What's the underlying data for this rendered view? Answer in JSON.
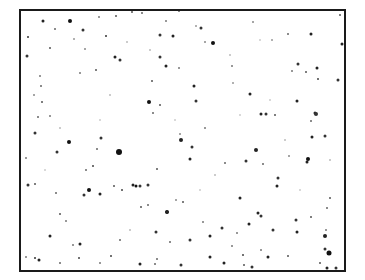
{
  "image": {
    "description": "Star field / speckle pattern framed by a black border",
    "frame_color": "#1a1a1a",
    "background": "#ffffff"
  },
  "dots": [
    [
      43,
      21,
      3,
      "#222"
    ],
    [
      70,
      21,
      4,
      "#111"
    ],
    [
      55,
      29,
      2,
      "#666"
    ],
    [
      116,
      16,
      2,
      "#555"
    ],
    [
      99,
      17,
      2,
      "#777"
    ],
    [
      28,
      37,
      2,
      "#333"
    ],
    [
      50,
      48,
      2,
      "#555"
    ],
    [
      83,
      30,
      3,
      "#333"
    ],
    [
      85,
      49,
      2,
      "#888"
    ],
    [
      106,
      36,
      2,
      "#333"
    ],
    [
      115,
      57,
      3,
      "#222"
    ],
    [
      120,
      60,
      3,
      "#333"
    ],
    [
      74,
      39,
      2,
      "#999"
    ],
    [
      80,
      73,
      2,
      "#777"
    ],
    [
      27,
      56,
      3,
      "#333"
    ],
    [
      41,
      86,
      2,
      "#666"
    ],
    [
      96,
      70,
      2,
      "#555"
    ],
    [
      40,
      76,
      2,
      "#777"
    ],
    [
      132,
      12,
      2,
      "#555"
    ],
    [
      142,
      13,
      2,
      "#666"
    ],
    [
      160,
      35,
      3,
      "#333"
    ],
    [
      173,
      36,
      3,
      "#222"
    ],
    [
      166,
      21,
      2,
      "#777"
    ],
    [
      179,
      11,
      2,
      "#666"
    ],
    [
      201,
      28,
      3,
      "#333"
    ],
    [
      213,
      43,
      4,
      "#111"
    ],
    [
      196,
      26,
      2,
      "#999"
    ],
    [
      160,
      57,
      3,
      "#333"
    ],
    [
      166,
      66,
      3,
      "#222"
    ],
    [
      152,
      81,
      2,
      "#555"
    ],
    [
      179,
      68,
      2,
      "#777"
    ],
    [
      194,
      86,
      3,
      "#222"
    ],
    [
      205,
      42,
      2,
      "#888"
    ],
    [
      232,
      66,
      2,
      "#777"
    ],
    [
      233,
      83,
      2,
      "#999"
    ],
    [
      253,
      22,
      2,
      "#888"
    ],
    [
      272,
      40,
      2,
      "#999"
    ],
    [
      311,
      34,
      3,
      "#222"
    ],
    [
      288,
      34,
      2,
      "#666"
    ],
    [
      342,
      44,
      3,
      "#222"
    ],
    [
      298,
      64,
      3,
      "#333"
    ],
    [
      306,
      72,
      2,
      "#555"
    ],
    [
      318,
      79,
      2,
      "#444"
    ],
    [
      292,
      71,
      2,
      "#777"
    ],
    [
      317,
      68,
      3,
      "#222"
    ],
    [
      338,
      80,
      3,
      "#333"
    ],
    [
      340,
      15,
      2,
      "#555"
    ],
    [
      42,
      102,
      2,
      "#555"
    ],
    [
      38,
      117,
      2,
      "#666"
    ],
    [
      50,
      116,
      2,
      "#777"
    ],
    [
      34,
      95,
      2,
      "#888"
    ],
    [
      35,
      133,
      3,
      "#333"
    ],
    [
      69,
      142,
      4,
      "#111"
    ],
    [
      57,
      152,
      3,
      "#333"
    ],
    [
      101,
      138,
      3,
      "#333"
    ],
    [
      119,
      152,
      6,
      "#111"
    ],
    [
      97,
      149,
      2,
      "#666"
    ],
    [
      93,
      166,
      2,
      "#444"
    ],
    [
      26,
      158,
      2,
      "#777"
    ],
    [
      86,
      170,
      2,
      "#666"
    ],
    [
      28,
      185,
      3,
      "#333"
    ],
    [
      149,
      102,
      4,
      "#111"
    ],
    [
      153,
      113,
      2,
      "#666"
    ],
    [
      160,
      105,
      2,
      "#555"
    ],
    [
      196,
      101,
      3,
      "#333"
    ],
    [
      205,
      128,
      2,
      "#777"
    ],
    [
      180,
      134,
      2,
      "#888"
    ],
    [
      181,
      140,
      4,
      "#222"
    ],
    [
      192,
      147,
      3,
      "#333"
    ],
    [
      190,
      159,
      3,
      "#222"
    ],
    [
      225,
      163,
      2,
      "#666"
    ],
    [
      157,
      169,
      2,
      "#555"
    ],
    [
      250,
      94,
      3,
      "#222"
    ],
    [
      275,
      115,
      2,
      "#555"
    ],
    [
      261,
      114,
      3,
      "#222"
    ],
    [
      266,
      114,
      3,
      "#333"
    ],
    [
      297,
      101,
      3,
      "#222"
    ],
    [
      315,
      113,
      3,
      "#222"
    ],
    [
      316,
      114,
      4,
      "#333"
    ],
    [
      311,
      121,
      2,
      "#666"
    ],
    [
      312,
      137,
      3,
      "#222"
    ],
    [
      325,
      136,
      3,
      "#333"
    ],
    [
      256,
      150,
      4,
      "#222"
    ],
    [
      246,
      161,
      3,
      "#333"
    ],
    [
      307,
      162,
      3,
      "#222"
    ],
    [
      308,
      159,
      4,
      "#111"
    ],
    [
      289,
      156,
      2,
      "#888"
    ],
    [
      278,
      178,
      3,
      "#333"
    ],
    [
      263,
      164,
      2,
      "#666"
    ],
    [
      35,
      184,
      2,
      "#555"
    ],
    [
      56,
      193,
      2,
      "#666"
    ],
    [
      89,
      190,
      4,
      "#111"
    ],
    [
      84,
      195,
      3,
      "#333"
    ],
    [
      100,
      194,
      3,
      "#222"
    ],
    [
      60,
      214,
      2,
      "#555"
    ],
    [
      66,
      221,
      2,
      "#777"
    ],
    [
      50,
      236,
      3,
      "#222"
    ],
    [
      80,
      244,
      3,
      "#222"
    ],
    [
      39,
      260,
      3,
      "#222"
    ],
    [
      35,
      258,
      2,
      "#333"
    ],
    [
      79,
      258,
      2,
      "#444"
    ],
    [
      73,
      245,
      2,
      "#777"
    ],
    [
      114,
      186,
      2,
      "#555"
    ],
    [
      122,
      190,
      2,
      "#444"
    ],
    [
      120,
      240,
      2,
      "#666"
    ],
    [
      133,
      185,
      3,
      "#222"
    ],
    [
      140,
      186,
      3,
      "#333"
    ],
    [
      136,
      186,
      3,
      "#111"
    ],
    [
      148,
      185,
      3,
      "#333"
    ],
    [
      141,
      207,
      2,
      "#555"
    ],
    [
      148,
      205,
      2,
      "#666"
    ],
    [
      167,
      212,
      4,
      "#111"
    ],
    [
      167,
      212,
      3,
      "#222"
    ],
    [
      183,
      202,
      2,
      "#555"
    ],
    [
      210,
      236,
      3,
      "#222"
    ],
    [
      190,
      240,
      3,
      "#333"
    ],
    [
      203,
      222,
      2,
      "#777"
    ],
    [
      156,
      232,
      3,
      "#333"
    ],
    [
      170,
      242,
      2,
      "#666"
    ],
    [
      157,
      259,
      2,
      "#666"
    ],
    [
      210,
      257,
      3,
      "#222"
    ],
    [
      176,
      200,
      2,
      "#888"
    ],
    [
      240,
      198,
      3,
      "#222"
    ],
    [
      249,
      224,
      3,
      "#222"
    ],
    [
      222,
      228,
      3,
      "#333"
    ],
    [
      243,
      255,
      2,
      "#444"
    ],
    [
      237,
      233,
      2,
      "#777"
    ],
    [
      277,
      186,
      3,
      "#222"
    ],
    [
      258,
      213,
      3,
      "#222"
    ],
    [
      261,
      216,
      3,
      "#333"
    ],
    [
      273,
      230,
      3,
      "#333"
    ],
    [
      297,
      232,
      3,
      "#222"
    ],
    [
      296,
      220,
      3,
      "#333"
    ],
    [
      311,
      217,
      2,
      "#555"
    ],
    [
      325,
      236,
      2,
      "#666"
    ],
    [
      330,
      198,
      2,
      "#555"
    ],
    [
      327,
      208,
      2,
      "#666"
    ],
    [
      326,
      230,
      2,
      "#777"
    ],
    [
      325,
      236,
      4,
      "#222"
    ],
    [
      329,
      253,
      5,
      "#111"
    ],
    [
      325,
      249,
      3,
      "#333"
    ],
    [
      320,
      263,
      2,
      "#555"
    ],
    [
      327,
      268,
      3,
      "#222"
    ],
    [
      336,
      268,
      3,
      "#333"
    ],
    [
      268,
      257,
      3,
      "#222"
    ],
    [
      252,
      267,
      3,
      "#333"
    ],
    [
      288,
      256,
      2,
      "#555"
    ],
    [
      261,
      250,
      2,
      "#777"
    ],
    [
      232,
      246,
      2,
      "#777"
    ],
    [
      224,
      263,
      3,
      "#222"
    ],
    [
      244,
      265,
      2,
      "#555"
    ],
    [
      181,
      265,
      3,
      "#333"
    ],
    [
      140,
      264,
      3,
      "#222"
    ],
    [
      155,
      264,
      2,
      "#666"
    ],
    [
      111,
      256,
      2,
      "#444"
    ],
    [
      100,
      263,
      2,
      "#777"
    ],
    [
      60,
      263,
      2,
      "#666"
    ],
    [
      26,
      257,
      2,
      "#777"
    ],
    [
      127,
      42,
      2,
      "#bbb"
    ],
    [
      150,
      50,
      2,
      "#bbb"
    ],
    [
      230,
      55,
      2,
      "#bbb"
    ],
    [
      270,
      100,
      2,
      "#ccc"
    ],
    [
      100,
      120,
      2,
      "#ccc"
    ],
    [
      60,
      128,
      2,
      "#bbb"
    ],
    [
      200,
      190,
      2,
      "#ccc"
    ],
    [
      285,
      140,
      2,
      "#bbb"
    ],
    [
      240,
      115,
      2,
      "#ccc"
    ],
    [
      130,
      230,
      2,
      "#bbb"
    ],
    [
      300,
      190,
      2,
      "#ccc"
    ],
    [
      45,
      170,
      2,
      "#ccc"
    ],
    [
      215,
      175,
      2,
      "#bbb"
    ],
    [
      175,
      120,
      2,
      "#ccc"
    ],
    [
      110,
      95,
      2,
      "#bbb"
    ],
    [
      260,
      40,
      2,
      "#ccc"
    ],
    [
      330,
      160,
      2,
      "#bbb"
    ]
  ]
}
